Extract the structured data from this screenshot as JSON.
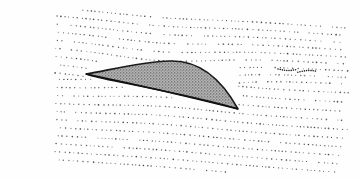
{
  "figure": {
    "colors": {
      "background": "#fefefe",
      "dots": "#333333",
      "airfoil_outline": "#1a1a1a",
      "airfoil_fill": "#8a8a8a"
    },
    "elements": [
      "streamlines",
      "airfoil",
      "wake-vortex"
    ]
  }
}
